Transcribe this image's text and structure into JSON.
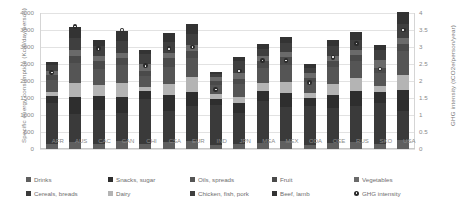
{
  "chart_data": {
    "type": "bar",
    "stacked": true,
    "title": "",
    "xlabel": "",
    "ylabel": "Specific energy consumption (Kcal/day/person)",
    "ylabel_right": "GHG intensity (tCO2e/person/year)",
    "ylim": [
      0,
      4000
    ],
    "ylim_right": [
      0,
      4
    ],
    "yticks": [
      "4000",
      "3500",
      "3000",
      "2500",
      "2000",
      "1500",
      "1000",
      "500",
      "0"
    ],
    "yticks_right": [
      "4",
      "3.5",
      "3",
      "2.5",
      "2",
      "1.5",
      "1",
      "0.5",
      "0"
    ],
    "grid": true,
    "legend_position": "bottom",
    "categories": [
      "AFR",
      "AUS",
      "CAC",
      "CAN",
      "CHI",
      "CSA",
      "EUR",
      "IND",
      "JPN",
      "MEA",
      "MEX",
      "ODA",
      "OEE",
      "RUS",
      "SKO",
      "USA"
    ],
    "series": [
      {
        "name": "Drinks",
        "color": "#5f5f5f",
        "values": [
          160,
          210,
          150,
          230,
          150,
          220,
          240,
          110,
          150,
          170,
          230,
          130,
          180,
          200,
          160,
          260
        ]
      },
      {
        "name": "Cereals, breads",
        "color": "#3a3a3a",
        "values": [
          1180,
          830,
          1000,
          830,
          1320,
          900,
          1020,
          1180,
          900,
          1230,
          1000,
          1150,
          1030,
          1070,
          1180,
          870
        ]
      },
      {
        "name": "Snacks, sugar",
        "color": "#2e2e2e",
        "values": [
          230,
          480,
          400,
          470,
          230,
          470,
          430,
          180,
          290,
          300,
          430,
          230,
          380,
          430,
          330,
          600
        ]
      },
      {
        "name": "Dairy",
        "color": "#b4b4b4",
        "values": [
          120,
          430,
          330,
          400,
          120,
          330,
          430,
          150,
          180,
          230,
          300,
          150,
          330,
          380,
          170,
          460
        ]
      },
      {
        "name": "Oils, spreads",
        "color": "#555555",
        "values": [
          330,
          580,
          480,
          550,
          330,
          500,
          560,
          250,
          380,
          450,
          520,
          300,
          480,
          520,
          400,
          680
        ]
      },
      {
        "name": "Fruit",
        "color": "#4a4a4a",
        "values": [
          150,
          220,
          230,
          200,
          150,
          250,
          210,
          130,
          150,
          200,
          220,
          140,
          180,
          170,
          150,
          220
        ]
      },
      {
        "name": "Vegetables",
        "color": "#6a6a6a",
        "values": [
          130,
          170,
          150,
          160,
          200,
          160,
          170,
          120,
          200,
          150,
          150,
          130,
          150,
          150,
          230,
          170
        ]
      },
      {
        "name": "Chicken, fish, pork",
        "color": "#3f3f3f",
        "values": [
          160,
          350,
          280,
          330,
          300,
          310,
          330,
          90,
          330,
          200,
          280,
          160,
          300,
          300,
          300,
          430
        ]
      },
      {
        "name": "Beef, lamb",
        "color": "#333333",
        "values": [
          110,
          310,
          190,
          290,
          120,
          260,
          280,
          50,
          140,
          150,
          180,
          100,
          190,
          230,
          140,
          330
        ]
      }
    ],
    "marker_series": {
      "name": "GHG intensity",
      "color": "#2b2b2b",
      "values": [
        2.25,
        3.6,
        2.95,
        3.5,
        2.45,
        2.95,
        3.0,
        1.75,
        2.3,
        2.6,
        2.6,
        1.95,
        2.7,
        3.1,
        2.35,
        3.5
      ]
    }
  },
  "legend": {
    "items": [
      {
        "label": "Drinks",
        "shape": "square"
      },
      {
        "label": "Cereals, breads",
        "shape": "square"
      },
      {
        "label": "Snacks, sugar",
        "shape": "square"
      },
      {
        "label": "Dairy",
        "shape": "square"
      },
      {
        "label": "Oils, spreads",
        "shape": "square"
      },
      {
        "label": "Chicken, fish, pork",
        "shape": "square"
      },
      {
        "label": "Fruit",
        "shape": "square"
      },
      {
        "label": "Beef, lamb",
        "shape": "square"
      },
      {
        "label": "Vegetables",
        "shape": "square"
      },
      {
        "label": "GHG intensity",
        "shape": "dot"
      }
    ]
  }
}
